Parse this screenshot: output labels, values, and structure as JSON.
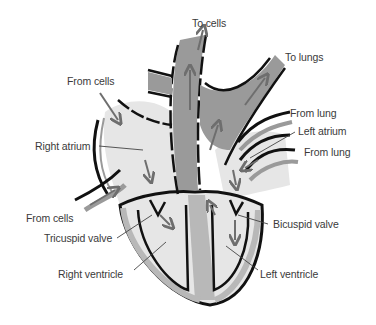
{
  "diagram": {
    "colors": {
      "outline": "#111111",
      "vessel_gray": "#9a9a9a",
      "chamber_light": "#e6e6e6",
      "septum": "#b8b8b8",
      "arrow": "#6e6e6e",
      "label_text": "#3a3a3a"
    },
    "labels": {
      "to_cells": "To cells",
      "to_lungs": "To lungs",
      "from_cells_top": "From cells",
      "right_atrium": "Right atrium",
      "from_lung_top": "From lung",
      "left_atrium": "Left atrium",
      "from_lung_bottom": "From lung",
      "from_cells_bottom": "From cells",
      "tricuspid_valve": "Tricuspid valve",
      "bicuspid_valve": "Bicuspid valve",
      "right_ventricle": "Right ventricle",
      "left_ventricle": "Left ventricle"
    }
  }
}
